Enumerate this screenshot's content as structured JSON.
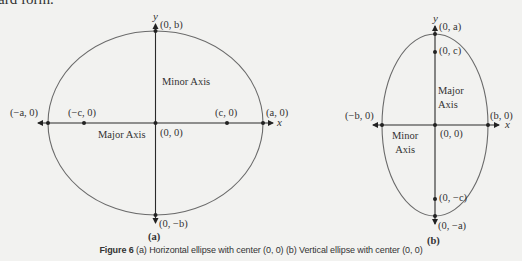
{
  "top_text": "ard form.",
  "figure_a": {
    "sublabel": "(a)",
    "axis_x": "x",
    "axis_y": "y",
    "points": {
      "top": "(0, b)",
      "bottom": "(0, −b)",
      "left_vertex": "(−a, 0)",
      "right_vertex": "(a, 0)",
      "left_focus": "(−c, 0)",
      "right_focus": "(c, 0)",
      "center": "(0, 0)"
    },
    "minor_axis_label": "Minor Axis",
    "major_axis_label": "Major Axis"
  },
  "figure_b": {
    "sublabel": "(b)",
    "axis_x": "x",
    "axis_y": "y",
    "points": {
      "top": "(0, a)",
      "bottom": "(0, −a)",
      "top_focus": "(0, c)",
      "bottom_focus": "(0, −c)",
      "left_vertex": "(−b, 0)",
      "right_vertex": "(b, 0)",
      "center": "(0, 0)"
    },
    "major_axis_label_line1": "Major",
    "major_axis_label_line2": "Axis",
    "minor_axis_label_line1": "Minor",
    "minor_axis_label_line2": "Axis"
  },
  "caption": {
    "figure_number": "Figure 6",
    "text": "(a) Horizontal ellipse with center (0, 0) (b) Vertical ellipse with center (0, 0)"
  },
  "colors": {
    "background": "#f2f2f0",
    "curve": "#6a6a6a",
    "axis": "#2a2a2a",
    "text": "#333333"
  }
}
